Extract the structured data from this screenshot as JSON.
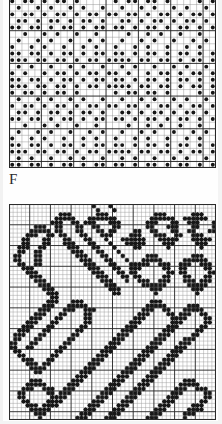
{
  "document": {
    "type": "needlework-pattern-chart-page",
    "label": "F",
    "background_color": "#ffffff",
    "ink_color": "#1a1a1a"
  },
  "chart_data": [
    {
      "id": "chart-top",
      "type": "heatmap",
      "title": "",
      "symbol": "filled-dot",
      "grid": {
        "columns": 32,
        "rows": 26,
        "cell_px": 6.45,
        "major_every": 5,
        "grid_on": true
      },
      "colors": {
        "filled": "#161616",
        "line_minor": "#8d8d8d",
        "line_major": "#262626",
        "cell": "#ffffff"
      },
      "legend": [],
      "rows": [
        "10110101101000001011011010000101",
        "01001010010100100100101001010010",
        "10110101101011011011010110101101",
        "01101011010110100110101101011010",
        "11011010110101101101011010110101",
        "00100101001001000010010100100100",
        "01001010010010100100101001001010",
        "10010100100101001001010010010100",
        "11011010110101101101011010110101",
        "11101101101011011110110110101101",
        "01010010010100100101001001010010",
        "10100101101011011010010110101101",
        "11011010110101101101011010110101",
        "11101101101011011110110110101101",
        "10110101101000001011011010000101",
        "01001010010100100100101001010010",
        "10110101101011011011010110101101",
        "01101011010110100110101101011010",
        "11011010110101101101011010110101",
        "00100101001001000010010100100100",
        "01001010010010100100101001001010",
        "10010100100101001001010010010100",
        "11011010110101101101011010110101",
        "11101101101011011110110110101101",
        "01010010010100100101001001010010",
        "11011010110101101101011010110101"
      ]
    },
    {
      "id": "chart-bottom",
      "type": "heatmap",
      "title": "",
      "symbol": "star-asterisk",
      "grid": {
        "columns": 50,
        "rows": 52,
        "cell_px": 4.14,
        "major_every": 5,
        "grid_on": true
      },
      "colors": {
        "filled": "#171717",
        "line_minor": "#9a9a9a",
        "line_major": "#2c2c2c",
        "cell": "#ffffff"
      },
      "legend": [],
      "rows": [
        "00000000000000000000100010000000000000000000000000",
        "00000000000000000000010001000000000000000000000000",
        "00000000000011100000011100000000000111000000111000",
        "00000000000111110001111111000000001111110011111100",
        "00000000001110011011100011100000011100011001110001",
        "00000011100110001100110001100000011000111000110001",
        "00000111110110001100011011000011001100011001100011",
        "00001110011011000110001110000111000111001100111000",
        "00011000110001100011000100011111100011111000111110",
        "00011000110001110001100010001111100001110000011100",
        "00111001100000111000110001000011000000100000001000",
        "00110011000000011100011000100000000000000000000000",
        "01100011000000001110001100010000011100000000111000",
        "01100011000000000111000110001000111110000011111100",
        "00110011000000000011100011000111110011100111001110",
        "00011100000000000001110001100111000001100110000110",
        "00001110000000000000111000110110000000110110000011",
        "00000111000000000000011100011011000001100011000110",
        "00000011100000000000001110001001110011100011101110",
        "00000001110000000000000111000000111111000001111100",
        "00000000111000000000000011100000001110000000111000",
        "00000000011100000000000001100000000100000000010000",
        "00000000001100000000000000000000000000000000000000",
        "00000000011100011100000000000000001110000000000000",
        "00000000111000111110000000000000011111000001110000",
        "00000001110001110011100000000000111001100011111000",
        "00000011100011000011000000000001110000110111001100",
        "00000111000110000011000000000011100000011110000110",
        "00001110001100000011000000000111000000011100000110",
        "00011100011000000110000000001110000000111000001100",
        "00111000110000001100000000011100000001110000011000",
        "01110001100000011000000000111000000011100000110000",
        "01100011000000110000000001110000000111000011100000",
        "11000110000001100000000011100000001110000111000000",
        "11001100000011000000000111000000011100001110000000",
        "01100000000110000000001110000000111000011100000000",
        "00110000001100000000011100000001110000111000000000",
        "00011100011000000000111000000011100001110000000000",
        "00001110110000000001110000000111000011100000000000",
        "00000111100000000011100000001110000111000000000000",
        "00000011000000000111000000011100001110000000000000",
        "00000000000000001110000000111000011100000000000000",
        "00000111000000011100000001110000111000000011100000",
        "00001111100000111000000011100001110000000111110000",
        "00011100111001110000000111000011100000001110011100",
        "00110000011011100000001110000111000000011100000110",
        "00110000001111000000011100001110000000111000000110",
        "00011000011110000000111000011100000001110000001100",
        "00001110111100000001110000111000000011100000111000",
        "00000111110000000011100001110000000111000001111000",
        "00000011100000000111000011100000001110000011100000",
        "00000001000000001110000111000000011100000010000000"
      ]
    }
  ]
}
